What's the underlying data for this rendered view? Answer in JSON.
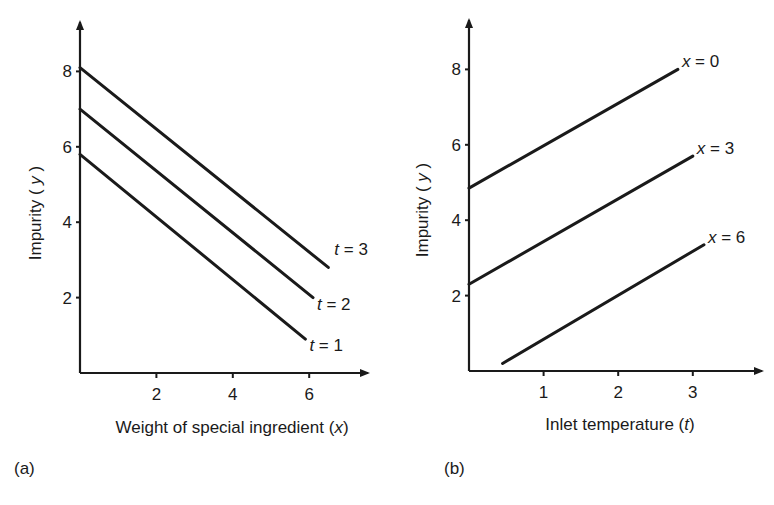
{
  "chart_data": [
    {
      "type": "line",
      "panel": "(a)",
      "title": "",
      "xlabel": "Weight of special ingredient (x)",
      "xlabel_parts": [
        "Weight of special ingredient (",
        "x",
        ")"
      ],
      "ylabel": "Impurity (y)",
      "ylabel_parts": [
        "Impurity ( ",
        "y",
        " )"
      ],
      "xticks": [
        2,
        4,
        6
      ],
      "yticks": [
        2,
        4,
        6,
        8
      ],
      "xlim": [
        0,
        7.5
      ],
      "ylim": [
        0,
        9
      ],
      "grid": false,
      "legend": "inline labels at line ends",
      "series": [
        {
          "name": "t = 3",
          "label_var": "t",
          "label_val": "3",
          "x": [
            0,
            6.5
          ],
          "y": [
            8.1,
            2.8
          ]
        },
        {
          "name": "t = 2",
          "label_var": "t",
          "label_val": "2",
          "x": [
            0,
            6.1
          ],
          "y": [
            7.0,
            2.0
          ]
        },
        {
          "name": "t = 1",
          "label_var": "t",
          "label_val": "1",
          "x": [
            0,
            5.9
          ],
          "y": [
            5.8,
            0.9
          ]
        }
      ]
    },
    {
      "type": "line",
      "panel": "(b)",
      "title": "",
      "xlabel": "Inlet temperature (t)",
      "xlabel_parts": [
        "Inlet temperature (",
        "t",
        ")"
      ],
      "ylabel": "Impurity (y)",
      "ylabel_parts": [
        "Impurity ( ",
        "y",
        " )"
      ],
      "xticks": [
        1,
        2,
        3
      ],
      "yticks": [
        2,
        4,
        6,
        8
      ],
      "xlim": [
        0,
        3.9
      ],
      "ylim": [
        0,
        9
      ],
      "grid": false,
      "legend": "inline labels at line ends",
      "series": [
        {
          "name": "x = 0",
          "label_var": "x",
          "label_val": "0",
          "x": [
            0,
            2.8
          ],
          "y": [
            4.85,
            8.0
          ]
        },
        {
          "name": "x = 3",
          "label_var": "x",
          "label_val": "3",
          "x": [
            0,
            3.0
          ],
          "y": [
            2.3,
            5.7
          ]
        },
        {
          "name": "x = 6",
          "label_var": "x",
          "label_val": "6",
          "x": [
            0.45,
            3.15
          ],
          "y": [
            0.2,
            3.35
          ]
        }
      ]
    }
  ],
  "panels": {
    "a": {
      "label": "(a)"
    },
    "b": {
      "label": "(b)"
    }
  },
  "style": {
    "ink": "#1a1a1a",
    "background": "#ffffff"
  }
}
